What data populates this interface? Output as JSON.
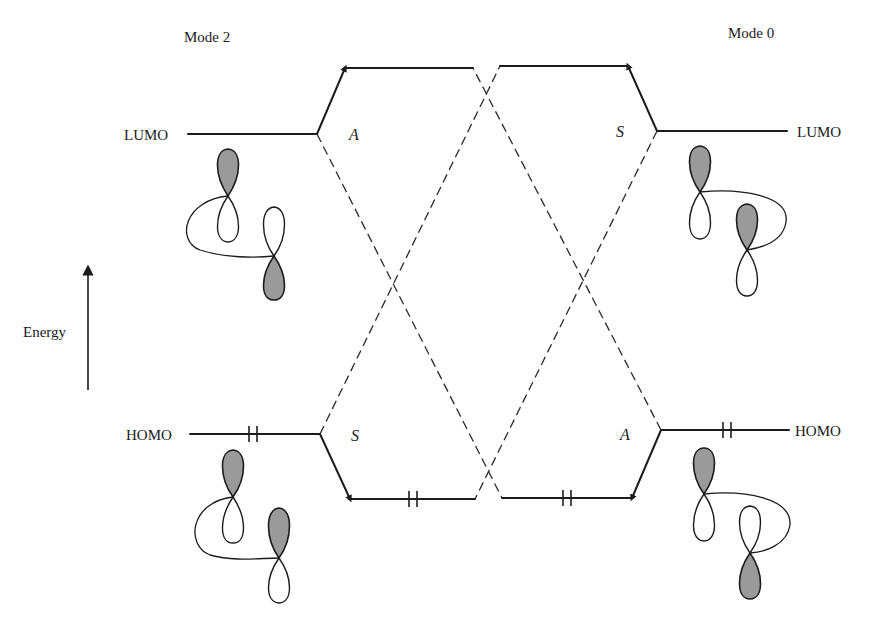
{
  "diagram": {
    "type": "orbital-correlation-diagram",
    "left_panel": {
      "mode_label": "Mode 2",
      "lumo_label": "LUMO",
      "homo_label": "HOMO",
      "lumo_symmetry": "A",
      "homo_symmetry": "S",
      "homo_electrons": "2 (paired)"
    },
    "right_panel": {
      "mode_label": "Mode 0",
      "lumo_label": "LUMO",
      "homo_label": "HOMO",
      "lumo_symmetry": "S",
      "homo_symmetry": "A",
      "homo_electrons": "2 (paired)"
    },
    "axis": {
      "label": "Energy",
      "direction": "up"
    },
    "center_levels": {
      "upper_left": "unoccupied (raised from left LUMO)",
      "upper_right": "unoccupied (raised from right LUMO)",
      "lower_left": "occupied (lowered from left HOMO)",
      "lower_right": "occupied (lowered from right HOMO)"
    },
    "correlation_lines": "dashed lines crossing between S and A levels",
    "colors": {
      "line": "#1c1c1c",
      "lobe_shaded": "#9a9a9a",
      "background": "#ffffff"
    }
  }
}
